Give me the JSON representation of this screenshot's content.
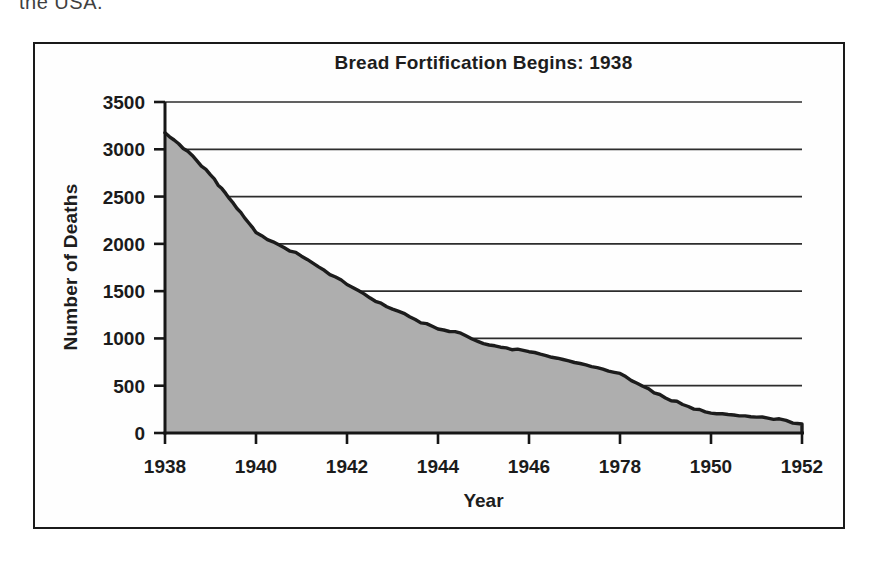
{
  "page": {
    "top_text": "the USA."
  },
  "figure": {
    "title": "Bread Fortification Begins: 1938",
    "x_axis_label": "Year",
    "y_axis_label": "Number of Deaths"
  },
  "chart_data": {
    "type": "area",
    "title": "Bread Fortification Begins: 1938",
    "xlabel": "Year",
    "ylabel": "Number of Deaths",
    "xlim": [
      1938,
      1952
    ],
    "ylim": [
      0,
      3500
    ],
    "grid": "horizontal",
    "legend": false,
    "background": "#ffffff",
    "x_ticks": [
      {
        "pos": 1938,
        "label": "1938"
      },
      {
        "pos": 1940,
        "label": "1940"
      },
      {
        "pos": 1942,
        "label": "1942"
      },
      {
        "pos": 1944,
        "label": "1944"
      },
      {
        "pos": 1946,
        "label": "1946"
      },
      {
        "pos": 1948,
        "label": "1978"
      },
      {
        "pos": 1950,
        "label": "1950"
      },
      {
        "pos": 1952,
        "label": "1952"
      }
    ],
    "y_ticks": [
      0,
      500,
      1000,
      1500,
      2000,
      2500,
      3000,
      3500
    ],
    "series": [
      {
        "fill_color": "#aeaeae",
        "line_color": "#1c1c1c",
        "points": [
          [
            1938,
            3175
          ],
          [
            1938.5,
            2980
          ],
          [
            1939,
            2730
          ],
          [
            1939.5,
            2430
          ],
          [
            1940,
            2120
          ],
          [
            1940.5,
            1990
          ],
          [
            1941,
            1870
          ],
          [
            1941.5,
            1720
          ],
          [
            1942,
            1570
          ],
          [
            1942.5,
            1430
          ],
          [
            1943,
            1310
          ],
          [
            1943.5,
            1200
          ],
          [
            1944,
            1100
          ],
          [
            1944.5,
            1055
          ],
          [
            1945,
            945
          ],
          [
            1945.5,
            900
          ],
          [
            1946,
            860
          ],
          [
            1946.5,
            800
          ],
          [
            1947,
            745
          ],
          [
            1947.5,
            690
          ],
          [
            1948,
            630
          ],
          [
            1948.5,
            495
          ],
          [
            1949,
            370
          ],
          [
            1949.5,
            280
          ],
          [
            1950,
            210
          ],
          [
            1950.5,
            190
          ],
          [
            1951,
            168
          ],
          [
            1951.5,
            150
          ],
          [
            1951.8,
            105
          ],
          [
            1952,
            95
          ]
        ]
      }
    ]
  }
}
